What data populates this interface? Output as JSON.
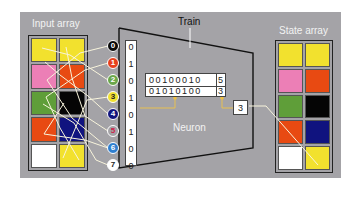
{
  "labels": {
    "input_array": "Input array",
    "state_array": "State array",
    "train": "Train",
    "neuron": "Neuron"
  },
  "colors": {
    "yellow": "#f2e12e",
    "pink": "#ec7fb6",
    "orange": "#e84a12",
    "green": "#5f9e39",
    "black": "#050505",
    "navy": "#10137f",
    "white": "#ffffff",
    "frame": "#a4a3a7",
    "wire": "#f8f4dc",
    "connector": "#f0c040"
  },
  "input_array": [
    [
      "yellow",
      "yellow"
    ],
    [
      "pink",
      "orange"
    ],
    [
      "green",
      "black"
    ],
    [
      "orange",
      "navy"
    ],
    [
      "white",
      "yellow"
    ]
  ],
  "state_array": [
    [
      "yellow",
      "yellow"
    ],
    [
      "pink",
      "orange"
    ],
    [
      "green",
      "black"
    ],
    [
      "orange",
      "navy"
    ],
    [
      "white",
      "yellow"
    ]
  ],
  "nodes": [
    {
      "label": "0",
      "bg": "#0a0a0a",
      "fg": "#ffffff"
    },
    {
      "label": "1",
      "bg": "#e8401c",
      "fg": "#ffffff"
    },
    {
      "label": "2",
      "bg": "#6aa64a",
      "fg": "#ffffff"
    },
    {
      "label": "3",
      "bg": "#f0e030",
      "fg": "#222222"
    },
    {
      "label": "4",
      "bg": "#12157e",
      "fg": "#ffffff"
    },
    {
      "label": "5",
      "bg": "#a4a3a7",
      "fg": "#d0204a"
    },
    {
      "label": "6",
      "bg": "#2f7fd0",
      "fg": "#ffffff"
    },
    {
      "label": "7",
      "bg": "#ffffff",
      "fg": "#222222"
    }
  ],
  "bits": [
    "0",
    "1",
    "0",
    "1",
    "0",
    "1",
    "0",
    "0"
  ],
  "neuron_table": [
    {
      "bits": "00100010",
      "value": "5"
    },
    {
      "bits": "01010100",
      "value": "3"
    }
  ],
  "output_value": "3"
}
